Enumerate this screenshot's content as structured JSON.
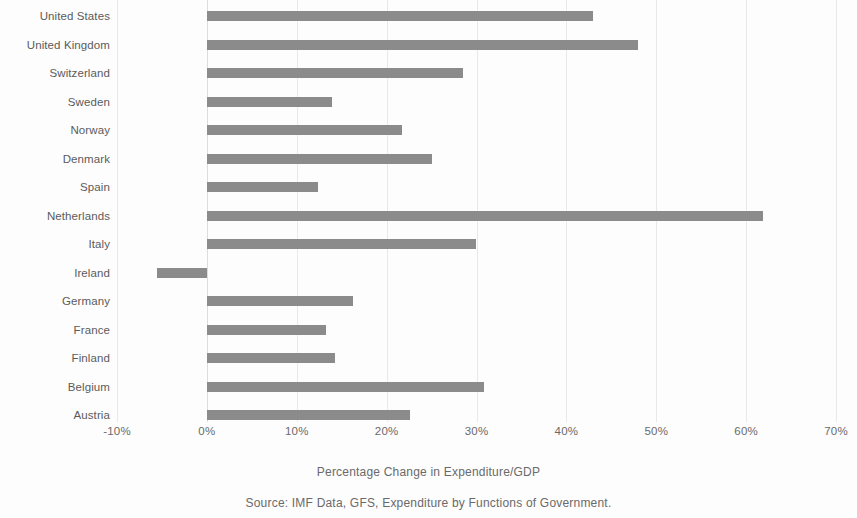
{
  "chart_data": {
    "type": "bar",
    "orientation": "horizontal",
    "title": "",
    "xlabel": "Percentage Change in Expenditure/GDP",
    "ylabel": "",
    "xlim": [
      -10,
      70
    ],
    "xticks": [
      -10,
      0,
      10,
      20,
      30,
      40,
      50,
      60,
      70
    ],
    "xticklabels": [
      "-10%",
      "0%",
      "10%",
      "20%",
      "30%",
      "40%",
      "50%",
      "60%",
      "70%"
    ],
    "grid": "vertical",
    "legend": "none",
    "bar_color": "#8b8b8b",
    "categories": [
      "United States",
      "United Kingdom",
      "Switzerland",
      "Sweden",
      "Norway",
      "Denmark",
      "Spain",
      "Netherlands",
      "Italy",
      "Ireland",
      "Germany",
      "France",
      "Finland",
      "Belgium",
      "Austria"
    ],
    "values": [
      43.0,
      48.0,
      28.5,
      13.9,
      21.7,
      25.0,
      12.4,
      61.9,
      29.9,
      -5.5,
      16.3,
      13.3,
      14.3,
      30.8,
      22.6
    ],
    "units": "percent"
  },
  "captions": {
    "axis_title": "Percentage Change in Expenditure/GDP",
    "source": "Source: IMF Data, GFS, Expenditure by Functions of Government."
  }
}
